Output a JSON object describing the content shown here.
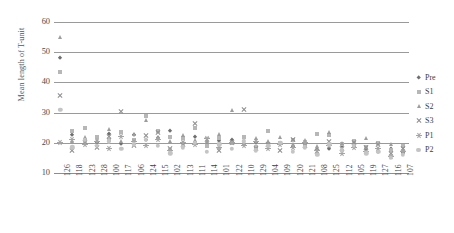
{
  "chart_data": {
    "type": "scatter",
    "title": "",
    "xlabel": "",
    "ylabel": "Mean length of T-unit",
    "ylim": [
      10,
      60
    ],
    "yticks": [
      10,
      20,
      30,
      40,
      50,
      60
    ],
    "grid": true,
    "legend_position": "right",
    "categories": [
      "126",
      "118",
      "123",
      "128",
      "100",
      "117",
      "106",
      "124",
      "115",
      "102",
      "113",
      "111",
      "114",
      "101",
      "122",
      "110",
      "129",
      "104",
      "109",
      "120",
      "121",
      "108",
      "125",
      "112",
      "105",
      "119",
      "127",
      "116",
      "107"
    ],
    "series": [
      {
        "name": "Pre",
        "marker": "diamond",
        "color": "#6f6f6f",
        "values": [
          48.0,
          22.5,
          21.0,
          20.0,
          23.0,
          19.5,
          22.5,
          20.8,
          21.5,
          24.0,
          20.0,
          22.0,
          19.0,
          20.5,
          21.0,
          19.5,
          20.0,
          19.0,
          19.5,
          18.5,
          19.0,
          17.5,
          18.0,
          19.0,
          18.5,
          17.5,
          17.0,
          18.0,
          16.5
        ]
      },
      {
        "name": "S1",
        "marker": "square",
        "color": "#b7b7b7",
        "values": [
          43.5,
          24.0,
          25.0,
          22.0,
          21.0,
          23.5,
          21.0,
          29.0,
          24.0,
          22.0,
          21.5,
          25.0,
          19.0,
          21.5,
          20.0,
          22.0,
          18.5,
          24.0,
          20.0,
          21.0,
          19.0,
          23.0,
          22.5,
          19.5,
          20.5,
          18.5,
          20.0,
          17.5,
          19.0
        ]
      },
      {
        "name": "S2",
        "marker": "triangle",
        "color": "#9d9d9d",
        "values": [
          55.0,
          20.5,
          22.0,
          21.0,
          24.5,
          20.5,
          23.0,
          27.5,
          22.0,
          20.5,
          22.5,
          21.0,
          20.5,
          23.0,
          31.0,
          20.0,
          21.5,
          20.5,
          22.0,
          19.5,
          21.0,
          19.0,
          23.5,
          20.0,
          19.5,
          21.5,
          18.0,
          19.5,
          17.5
        ]
      },
      {
        "name": "S3",
        "marker": "x",
        "color": "#8f8f8f",
        "values": [
          35.5,
          17.5,
          20.0,
          18.5,
          22.0,
          30.5,
          19.0,
          22.5,
          23.5,
          18.0,
          19.5,
          26.5,
          21.0,
          17.5,
          20.0,
          31.0,
          18.0,
          19.5,
          17.5,
          21.0,
          19.0,
          17.0,
          20.5,
          18.0,
          20.0,
          18.5,
          19.5,
          16.5,
          18.0
        ]
      },
      {
        "name": "P1",
        "marker": "star",
        "color": "#a5a5a5",
        "values": [
          20.0,
          21.0,
          19.5,
          20.5,
          18.0,
          22.0,
          20.5,
          19.0,
          21.0,
          17.5,
          20.0,
          19.5,
          21.5,
          18.5,
          20.0,
          19.0,
          20.5,
          18.0,
          19.5,
          18.5,
          20.0,
          17.5,
          19.0,
          16.5,
          18.5,
          17.0,
          18.0,
          15.5,
          17.0
        ]
      },
      {
        "name": "P2",
        "marker": "circle",
        "color": "#c4c4c4",
        "values": [
          31.0,
          18.5,
          21.0,
          19.0,
          20.5,
          18.0,
          19.5,
          21.0,
          19.0,
          16.5,
          18.5,
          20.0,
          17.0,
          19.5,
          18.0,
          20.5,
          17.5,
          19.0,
          20.0,
          17.0,
          18.5,
          16.0,
          19.5,
          17.5,
          19.0,
          16.5,
          17.0,
          15.0,
          16.0
        ]
      }
    ]
  },
  "legend": {
    "items": [
      {
        "label": "Pre",
        "marker": "diamond"
      },
      {
        "label": "S1",
        "marker": "square"
      },
      {
        "label": "S2",
        "marker": "triangle"
      },
      {
        "label": "S3",
        "marker": "x"
      },
      {
        "label": "P1",
        "marker": "star"
      },
      {
        "label": "P2",
        "marker": "circle"
      }
    ]
  }
}
